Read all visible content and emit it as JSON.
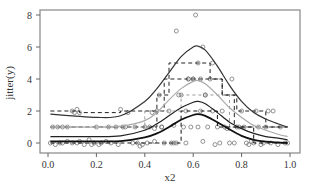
{
  "chart_data": {
    "type": "scatter",
    "title": "",
    "xlabel": "x2",
    "ylabel": "jitter(y)",
    "xlim": [
      0.0,
      1.0
    ],
    "ylim": [
      -0.4,
      8.2
    ],
    "x_ticks": [
      "0.0",
      "0.2",
      "0.4",
      "0.6",
      "0.8",
      "1.0"
    ],
    "x_tick_values": [
      0.0,
      0.2,
      0.4,
      0.6,
      0.8,
      1.0
    ],
    "y_ticks": [
      "0",
      "2",
      "4",
      "6",
      "8"
    ],
    "y_tick_values": [
      0,
      2,
      4,
      6,
      8
    ],
    "grid": false,
    "legend": null,
    "smooth_curves": [
      {
        "name": "curve-top",
        "color": "#333333",
        "width": 1.2,
        "x": [
          0.01,
          0.1,
          0.2,
          0.3,
          0.4,
          0.45,
          0.5,
          0.55,
          0.6,
          0.62,
          0.65,
          0.7,
          0.75,
          0.8,
          0.85,
          0.9,
          0.95,
          0.99
        ],
        "y": [
          1.8,
          1.7,
          1.6,
          1.7,
          2.6,
          3.4,
          4.4,
          5.4,
          6.0,
          6.05,
          5.8,
          4.8,
          3.6,
          2.6,
          1.9,
          1.5,
          1.2,
          1.0
        ]
      },
      {
        "name": "curve-gray",
        "color": "#aaaaaa",
        "width": 1.2,
        "x": [
          0.01,
          0.1,
          0.2,
          0.3,
          0.4,
          0.45,
          0.5,
          0.55,
          0.6,
          0.62,
          0.65,
          0.7,
          0.75,
          0.8,
          0.85,
          0.9,
          0.95,
          0.99
        ],
        "y": [
          1.0,
          1.0,
          1.0,
          1.05,
          1.4,
          1.9,
          2.7,
          3.4,
          3.85,
          3.9,
          3.7,
          3.0,
          2.2,
          1.6,
          1.1,
          0.8,
          0.55,
          0.4
        ]
      },
      {
        "name": "curve-mid",
        "color": "#222222",
        "width": 1.2,
        "x": [
          0.01,
          0.1,
          0.2,
          0.3,
          0.4,
          0.45,
          0.5,
          0.55,
          0.6,
          0.62,
          0.65,
          0.7,
          0.75,
          0.8,
          0.85,
          0.9,
          0.95,
          0.99
        ],
        "y": [
          0.4,
          0.4,
          0.4,
          0.45,
          0.8,
          1.2,
          1.7,
          2.2,
          2.55,
          2.6,
          2.45,
          1.9,
          1.3,
          0.9,
          0.6,
          0.4,
          0.3,
          0.2
        ]
      },
      {
        "name": "curve-bottom",
        "color": "#111111",
        "width": 1.8,
        "x": [
          0.01,
          0.1,
          0.2,
          0.3,
          0.4,
          0.45,
          0.5,
          0.55,
          0.6,
          0.62,
          0.65,
          0.7,
          0.75,
          0.8,
          0.85,
          0.9,
          0.95,
          0.99
        ],
        "y": [
          0.1,
          0.1,
          0.1,
          0.12,
          0.35,
          0.6,
          1.0,
          1.45,
          1.75,
          1.8,
          1.7,
          1.3,
          0.85,
          0.45,
          0.2,
          0.08,
          0.03,
          0.0
        ]
      }
    ],
    "step_lines": [
      {
        "name": "step-top",
        "color": "#222222",
        "dash": "4,3",
        "x": [
          0.01,
          0.13,
          0.13,
          0.3,
          0.3,
          0.45,
          0.45,
          0.5,
          0.5,
          0.67,
          0.67,
          0.72,
          0.72,
          0.78,
          0.78,
          0.9,
          0.9,
          0.99
        ],
        "y": [
          2.0,
          2.0,
          1.9,
          1.9,
          2.0,
          2.0,
          3.0,
          3.0,
          5.0,
          5.0,
          4.0,
          4.0,
          3.0,
          3.0,
          2.0,
          2.0,
          1.0,
          1.0
        ]
      },
      {
        "name": "step-mid",
        "color": "#222222",
        "dash": "4,3",
        "x": [
          0.01,
          0.3,
          0.3,
          0.45,
          0.45,
          0.48,
          0.48,
          0.72,
          0.72,
          0.77,
          0.77,
          0.99
        ],
        "y": [
          1.0,
          1.0,
          1.0,
          1.0,
          2.0,
          2.0,
          4.0,
          4.0,
          3.0,
          3.0,
          1.0,
          1.0
        ]
      },
      {
        "name": "step-gray",
        "color": "#999999",
        "dash": "3,3",
        "x": [
          0.01,
          0.4,
          0.4,
          0.55,
          0.55,
          0.75,
          0.75,
          0.99
        ],
        "y": [
          1.0,
          1.0,
          2.0,
          2.0,
          3.0,
          3.0,
          1.0,
          1.0
        ]
      },
      {
        "name": "step-low",
        "color": "#111111",
        "dash": "4,3",
        "x": [
          0.01,
          0.55,
          0.55,
          0.7,
          0.7,
          0.85,
          0.85,
          0.99
        ],
        "y": [
          0.0,
          0.0,
          2.0,
          2.0,
          1.0,
          1.0,
          0.0,
          0.0
        ]
      }
    ],
    "points": {
      "marker": "open-circle",
      "color": "#777777",
      "x": [
        0.01,
        0.03,
        0.05,
        0.06,
        0.08,
        0.1,
        0.11,
        0.12,
        0.13,
        0.13,
        0.02,
        0.04,
        0.06,
        0.08,
        0.1,
        0.12,
        0.15,
        0.17,
        0.18,
        0.19,
        0.2,
        0.21,
        0.22,
        0.24,
        0.26,
        0.28,
        0.29,
        0.3,
        0.31,
        0.33,
        0.35,
        0.36,
        0.38,
        0.39,
        0.4,
        0.41,
        0.42,
        0.43,
        0.44,
        0.45,
        0.46,
        0.47,
        0.48,
        0.5,
        0.51,
        0.52,
        0.53,
        0.54,
        0.55,
        0.56,
        0.57,
        0.58,
        0.59,
        0.6,
        0.61,
        0.62,
        0.63,
        0.64,
        0.65,
        0.66,
        0.67,
        0.68,
        0.7,
        0.71,
        0.72,
        0.73,
        0.74,
        0.75,
        0.76,
        0.77,
        0.78,
        0.8,
        0.81,
        0.82,
        0.83,
        0.84,
        0.85,
        0.86,
        0.87,
        0.88,
        0.89,
        0.9,
        0.91,
        0.92,
        0.93,
        0.95,
        0.96,
        0.98,
        0.99,
        0.25,
        0.32,
        0.37,
        0.44,
        0.47,
        0.53,
        0.58,
        0.63,
        0.69,
        0.79,
        0.57,
        0.62,
        0.65,
        0.52,
        0.6,
        0.64,
        0.68
      ],
      "y": [
        0.0,
        -0.1,
        0.0,
        1.0,
        1.0,
        2.0,
        1.9,
        2.1,
        1.9,
        0.1,
        1.0,
        1.0,
        0.0,
        0.1,
        0.0,
        0.0,
        -0.1,
        0.2,
        -0.1,
        0.0,
        1.0,
        -0.1,
        0.0,
        0.1,
        0.0,
        1.0,
        -0.1,
        2.1,
        1.0,
        1.9,
        0.0,
        1.0,
        -0.2,
        -0.1,
        1.0,
        0.0,
        1.0,
        1.9,
        0.1,
        2.0,
        3.0,
        1.0,
        0.0,
        2.0,
        0.0,
        1.1,
        7.0,
        3.0,
        3.0,
        1.0,
        2.0,
        4.0,
        1.0,
        4.0,
        8.0,
        1.0,
        4.0,
        6.0,
        3.0,
        1.0,
        4.0,
        5.0,
        1.0,
        0.0,
        2.0,
        1.0,
        0.9,
        0.0,
        4.0,
        0.0,
        1.0,
        2.0,
        1.0,
        0.0,
        -0.1,
        0.1,
        0.0,
        2.0,
        1.0,
        -0.1,
        0.0,
        1.0,
        2.0,
        0.0,
        2.0,
        -0.1,
        1.0,
        0.0,
        0.0,
        1.0,
        1.0,
        0.0,
        0.9,
        1.0,
        0.0,
        4.0,
        2.0,
        -0.1,
        1.0,
        0.0,
        5.0,
        3.0,
        0.0,
        4.0,
        0.1,
        2.0
      ]
    }
  }
}
